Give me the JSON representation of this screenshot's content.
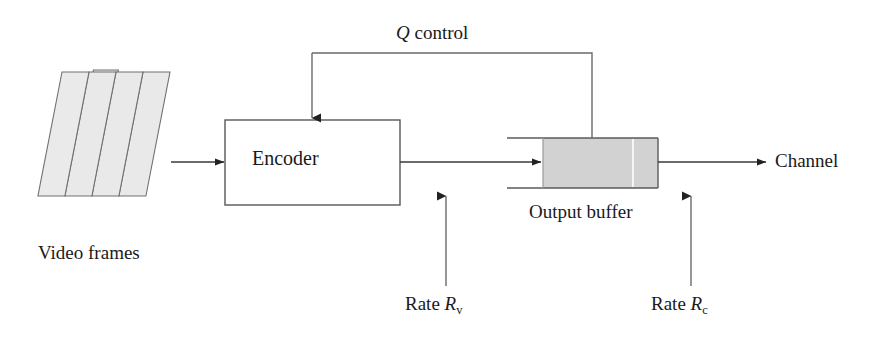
{
  "diagram": {
    "background_color": "#ffffff",
    "line_color": "#3a3a3a",
    "fill_color": "#d2d2d2",
    "nodes": {
      "video_frames": {
        "label": "Video frames",
        "shape": "stacked-parallelograms",
        "count": 4
      },
      "encoder": {
        "label": "Encoder",
        "shape": "rectangle"
      },
      "output_buffer": {
        "label": "Output buffer",
        "shape": "open-buffer",
        "fill": "#d2d2d2"
      },
      "channel": {
        "label": "Channel",
        "shape": "text-sink"
      }
    },
    "edges": {
      "frames_to_encoder": {
        "label": ""
      },
      "encoder_to_buffer": {
        "label": ""
      },
      "buffer_to_channel": {
        "label": ""
      },
      "feedback": {
        "label_prefix": "Q",
        "label_suffix": " control",
        "label_full": "Q control",
        "from": "output_buffer",
        "to": "encoder"
      },
      "rate_video": {
        "label_prefix": "Rate ",
        "label_symbol": "R",
        "label_subscript": "v",
        "label_full": "Rate Rv"
      },
      "rate_channel": {
        "label_prefix": "Rate ",
        "label_symbol": "R",
        "label_subscript": "c",
        "label_full": "Rate Rc"
      }
    }
  }
}
